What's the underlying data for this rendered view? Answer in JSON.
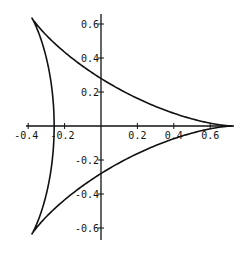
{
  "chart_data": {
    "type": "line",
    "title": "",
    "xlabel": "",
    "ylabel": "",
    "xlim": [
      -0.4,
      0.72
    ],
    "ylim": [
      -0.66,
      0.66
    ],
    "grid": false,
    "legend": null,
    "x_ticks": [
      -0.4,
      -0.2,
      0.2,
      0.4,
      0.6
    ],
    "x_tick_labels": [
      "-0.4",
      "-0.2",
      "0.2",
      "0.4",
      "0.6"
    ],
    "y_ticks": [
      0.6,
      0.4,
      0.2,
      -0.2,
      -0.4,
      -0.6
    ],
    "y_tick_labels": [
      "0.6",
      "0.4",
      "0.2",
      "-0.2",
      "-0.4",
      "-0.6"
    ],
    "curve": {
      "kind": "deltoid",
      "r": 0.2444,
      "center_x": -0.013,
      "center_y": 0,
      "cusps": [
        [
          0.72,
          0
        ],
        [
          -0.38,
          0.635
        ],
        [
          -0.38,
          -0.635
        ]
      ],
      "y_intercepts": [
        0.3,
        -0.3
      ],
      "x_intercepts": [
        -0.25,
        0.72
      ]
    },
    "stroke_color": "#111111"
  }
}
